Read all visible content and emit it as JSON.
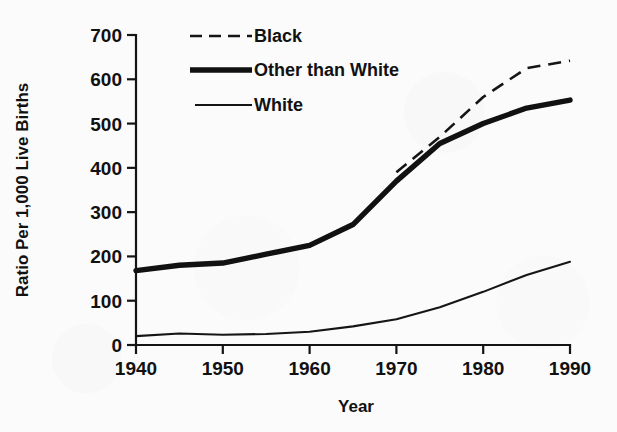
{
  "chart_data": {
    "type": "line",
    "title": "",
    "subtitle": "",
    "xlabel": "Year",
    "ylabel": "Ratio Per 1,000 Live Births",
    "xlim": [
      1940,
      1990
    ],
    "ylim": [
      0,
      700
    ],
    "xticks": [
      1940,
      1950,
      1960,
      1970,
      1980,
      1990
    ],
    "xtick_labels": [
      "1940",
      "1950",
      "1960",
      "1970",
      "1980",
      "1990"
    ],
    "yticks": [
      0,
      100,
      200,
      300,
      400,
      500,
      600,
      700
    ],
    "ytick_labels": [
      "0",
      "100",
      "200",
      "300",
      "400",
      "500",
      "600",
      "700"
    ],
    "grid": false,
    "legend_position": "top-left-inside",
    "series": [
      {
        "name": "Black",
        "style": "dashed",
        "x": [
          1970,
          1975,
          1980,
          1985,
          1990
        ],
        "values": [
          390,
          470,
          560,
          625,
          642
        ]
      },
      {
        "name": "Other than White",
        "style": "thick-solid",
        "x": [
          1940,
          1945,
          1950,
          1955,
          1960,
          1965,
          1970,
          1975,
          1980,
          1985,
          1990
        ],
        "values": [
          168,
          180,
          185,
          205,
          225,
          272,
          370,
          455,
          500,
          535,
          553
        ]
      },
      {
        "name": "White",
        "style": "thin-solid",
        "x": [
          1940,
          1945,
          1950,
          1955,
          1960,
          1965,
          1970,
          1975,
          1980,
          1985,
          1990
        ],
        "values": [
          20,
          26,
          23,
          25,
          30,
          42,
          58,
          85,
          120,
          158,
          188
        ]
      }
    ]
  },
  "legend": {
    "entries": [
      {
        "label": "Black",
        "style": "dashed"
      },
      {
        "label": "Other than White",
        "style": "thick-solid"
      },
      {
        "label": "White",
        "style": "thin-solid"
      }
    ]
  },
  "axes": {
    "x_title": "Year",
    "y_title": "Ratio Per 1,000 Live Births"
  },
  "colors": {
    "ink": "#111111",
    "paper": "#fbfbfb"
  }
}
